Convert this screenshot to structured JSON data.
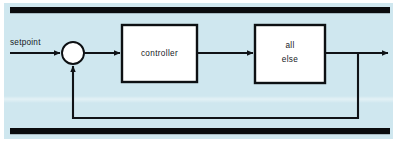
{
  "figure": {
    "kind": "block-diagram",
    "background_color": "#cfe7ef",
    "line_color": "#101317",
    "box_fill_color": "#ffffff",
    "page_color": "#ffffff"
  },
  "rules": {
    "top_bar_label": "",
    "bottom_bar_label": ""
  },
  "labels": {
    "setpoint": "setpoint"
  },
  "blocks": [
    {
      "id": "controller",
      "label": "controller",
      "lines": [
        "controller"
      ],
      "x": 122,
      "y": 25,
      "w": 75,
      "h": 57
    },
    {
      "id": "all-else",
      "label": "all else",
      "lines": [
        "all",
        "else"
      ],
      "x": 255,
      "y": 25,
      "w": 70,
      "h": 58
    }
  ],
  "junction": {
    "id": "summing-junction",
    "label": "",
    "cx": 73,
    "cy": 53,
    "r": 11
  },
  "signals": [
    {
      "id": "setpoint-in",
      "from": "input",
      "to": "summing-junction",
      "arrow": true
    },
    {
      "id": "error-to-ctrl",
      "from": "summing-junction",
      "to": "controller",
      "arrow": true
    },
    {
      "id": "ctrl-to-plant",
      "from": "controller",
      "to": "all-else",
      "arrow": true
    },
    {
      "id": "plant-output",
      "from": "all-else",
      "to": "output",
      "arrow": true
    },
    {
      "id": "feedback-path",
      "from": "all-else",
      "to": "summing-junction",
      "arrow": true
    }
  ]
}
